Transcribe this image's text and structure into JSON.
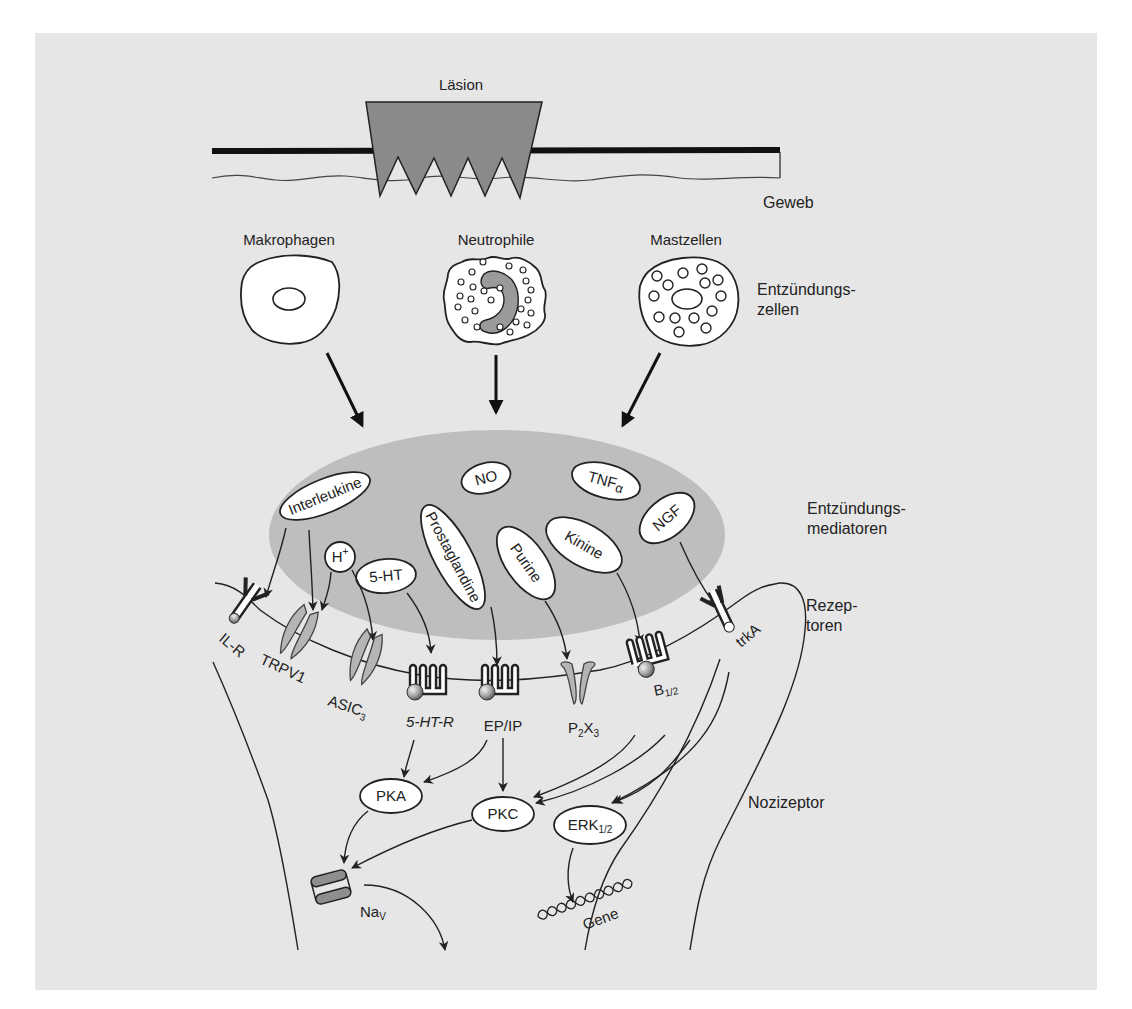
{
  "colors": {
    "panel_bg": "#e6e6e6",
    "lesion_fill": "#8a8a8a",
    "mediator_zone": "#b9b9b9",
    "channel_fill": "#b5b5b5",
    "ink": "#222222"
  },
  "top": {
    "lesion_label": "Läsion",
    "tissue_label": "Geweb"
  },
  "cells": {
    "macrophages": "Makrophagen",
    "neutrophils": "Neutrophile",
    "mast_cells": "Mastzellen",
    "side_label_line1": "Entzündungs-",
    "side_label_line2": "zellen"
  },
  "mediators": {
    "side_label_line1": "Entzündungs-",
    "side_label_line2": "mediatoren",
    "interleukine": "Interleukine",
    "no": "NO",
    "tnf": "TNF",
    "tnf_sub": "α",
    "ngf": "NGF",
    "h_plus": "H",
    "h_plus_sup": "+",
    "serotonin": "5-HT",
    "prostaglandine": "Prostaglandine",
    "purine": "Purine",
    "kinine": "Kinine"
  },
  "receptors": {
    "side_label_line1": "Rezep-",
    "side_label_line2": "toren",
    "il_r": "IL-R",
    "trpv1": "TRPV1",
    "asic": "ASIC",
    "asic_sub": "3",
    "ht_r": "5-HT-R",
    "ep_ip": "EP/IP",
    "p2x": "P",
    "p2x_sub1": "2",
    "p2x_mid": "X",
    "p2x_sub2": "3",
    "b12": "B",
    "b12_sub": "1/2",
    "trka": "trkA"
  },
  "nociceptor": {
    "side_label": "Nozizeptor",
    "pka": "PKA",
    "pkc": "PKC",
    "erk": "ERK",
    "erk_sub": "1/2",
    "nav": "Na",
    "nav_sub": "V",
    "gene": "Gene"
  }
}
